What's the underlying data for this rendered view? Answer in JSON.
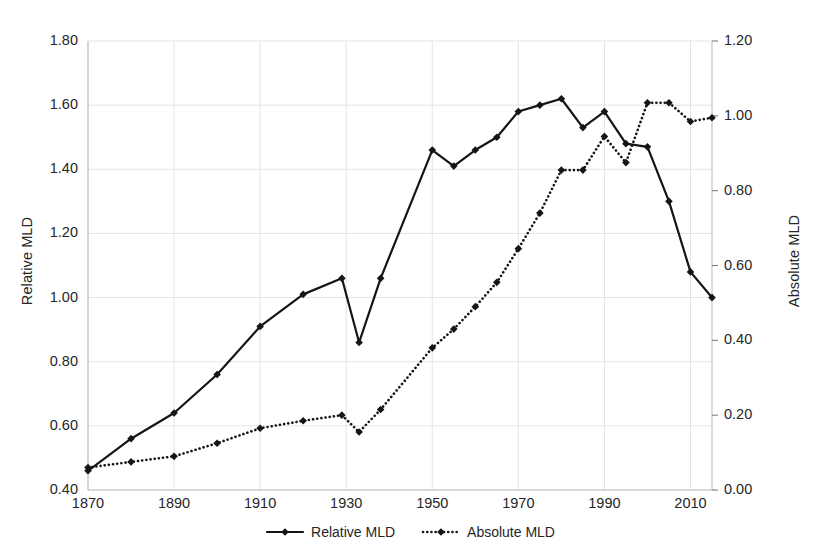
{
  "chart_data": {
    "type": "line",
    "title": "",
    "xlabel": "",
    "ylabel": "Relative MLD",
    "y2label": "Absolute MLD",
    "grid": true,
    "legend_position": "bottom",
    "xlim": [
      1870,
      2015
    ],
    "ylim": [
      0.4,
      1.8
    ],
    "y2lim": [
      0.0,
      1.2
    ],
    "xticks": [
      "1870",
      "1890",
      "1910",
      "1930",
      "1950",
      "1970",
      "1990",
      "2010"
    ],
    "xtick_values": [
      1870,
      1890,
      1910,
      1930,
      1950,
      1970,
      1990,
      2010
    ],
    "yticks_left": [
      "0.40",
      "0.60",
      "0.80",
      "1.00",
      "1.20",
      "1.40",
      "1.60",
      "1.80"
    ],
    "ytick_left_values": [
      0.4,
      0.6,
      0.8,
      1.0,
      1.2,
      1.4,
      1.6,
      1.8
    ],
    "yticks_right": [
      "0.00",
      "0.20",
      "0.40",
      "0.60",
      "0.80",
      "1.00",
      "1.20"
    ],
    "ytick_right_values": [
      0.0,
      0.2,
      0.4,
      0.6,
      0.8,
      1.0,
      1.2
    ],
    "series": [
      {
        "name": "Relative MLD",
        "axis": "left",
        "style": "solid",
        "color": "#151515",
        "marker": "diamond",
        "x": [
          1870,
          1880,
          1890,
          1900,
          1910,
          1920,
          1929,
          1933,
          1938,
          1950,
          1955,
          1960,
          1965,
          1970,
          1975,
          1980,
          1985,
          1990,
          1995,
          2000,
          2005,
          2010,
          2015
        ],
        "values": [
          0.46,
          0.56,
          0.64,
          0.76,
          0.91,
          1.01,
          1.06,
          0.86,
          1.06,
          1.46,
          1.41,
          1.46,
          1.5,
          1.58,
          1.6,
          1.62,
          1.53,
          1.58,
          1.48,
          1.47,
          1.3,
          1.08,
          1.0
        ]
      },
      {
        "name": "Absolute MLD",
        "axis": "right",
        "style": "dotted",
        "color": "#151515",
        "marker": "diamond",
        "x": [
          1870,
          1880,
          1890,
          1900,
          1910,
          1920,
          1929,
          1933,
          1938,
          1950,
          1955,
          1960,
          1965,
          1970,
          1975,
          1980,
          1985,
          1990,
          1995,
          2000,
          2005,
          2010,
          2015
        ],
        "values": [
          0.06,
          0.075,
          0.09,
          0.125,
          0.165,
          0.185,
          0.2,
          0.155,
          0.215,
          0.38,
          0.43,
          0.49,
          0.555,
          0.645,
          0.74,
          0.855,
          0.855,
          0.945,
          0.875,
          1.035,
          1.035,
          0.985,
          0.995
        ]
      }
    ]
  },
  "legend": {
    "items": [
      {
        "label": "Relative MLD",
        "style": "solid"
      },
      {
        "label": "Absolute MLD",
        "style": "dotted"
      }
    ]
  }
}
